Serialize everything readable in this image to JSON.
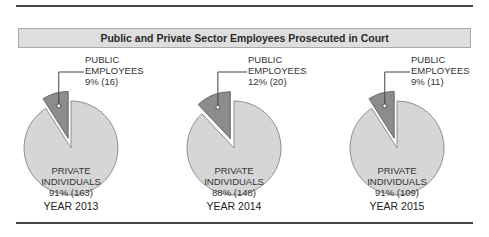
{
  "chart_data": {
    "type": "pie",
    "title": "Public and Private Sector Employees Prosecuted in Court",
    "charts": [
      {
        "year_label": "YEAR 2013",
        "slices": [
          {
            "name": "PUBLIC EMPLOYEES",
            "percent": 9,
            "count": 16,
            "color": "#8c8c8c",
            "exploded": true
          },
          {
            "name": "PRIVATE INDIVIDUALS",
            "percent": 91,
            "count": 163,
            "color": "#d6d6d6"
          }
        ]
      },
      {
        "year_label": "YEAR 2014",
        "slices": [
          {
            "name": "PUBLIC EMPLOYEES",
            "percent": 12,
            "count": 20,
            "color": "#8c8c8c",
            "exploded": true
          },
          {
            "name": "PRIVATE INDIVIDUALS",
            "percent": 88,
            "count": 148,
            "color": "#d6d6d6"
          }
        ]
      },
      {
        "year_label": "YEAR 2015",
        "slices": [
          {
            "name": "PUBLIC EMPLOYEES",
            "percent": 9,
            "count": 11,
            "color": "#8c8c8c",
            "exploded": true
          },
          {
            "name": "PRIVATE INDIVIDUALS",
            "percent": 91,
            "count": 109,
            "color": "#d6d6d6"
          }
        ]
      }
    ]
  },
  "title": "Public and Private Sector Employees Prosecuted in Court",
  "charts": [
    {
      "pub_l1": "PUBLIC",
      "pub_l2": "EMPLOYEES",
      "pub_l3": "9% (16)",
      "priv_l1": "PRIVATE",
      "priv_l2": "INDIVIDUALS",
      "priv_l3": "91% (163)",
      "year": "YEAR 2013"
    },
    {
      "pub_l1": "PUBLIC",
      "pub_l2": "EMPLOYEES",
      "pub_l3": "12% (20)",
      "priv_l1": "PRIVATE",
      "priv_l2": "INDIVIDUALS",
      "priv_l3": "88% (148)",
      "year": "YEAR 2014"
    },
    {
      "pub_l1": "PUBLIC",
      "pub_l2": "EMPLOYEES",
      "pub_l3": "9% (11)",
      "priv_l1": "PRIVATE",
      "priv_l2": "INDIVIDUALS",
      "priv_l3": "91% (109)",
      "year": "YEAR 2015"
    }
  ]
}
